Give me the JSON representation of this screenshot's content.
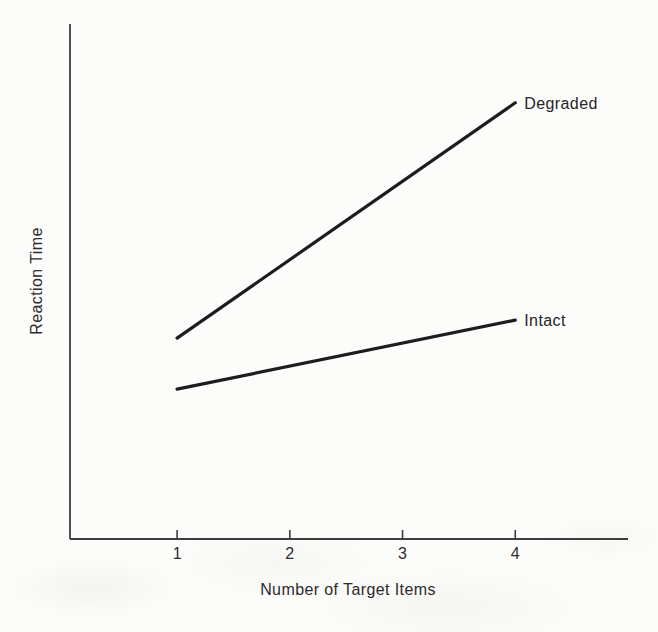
{
  "figure": {
    "background": "#fcfcfa",
    "axis_color": "#3d3d3d",
    "line_color": "#1d1d1d",
    "text_color": "#2c2c2c"
  },
  "chart_data": {
    "type": "line",
    "title": "",
    "xlabel": "Number of Target Items",
    "ylabel": "Reaction Time",
    "xlim": [
      0.05,
      5.0
    ],
    "ylim": [
      0,
      1
    ],
    "xticks": [
      1,
      2,
      3,
      4
    ],
    "xtick_labels": [
      "1",
      "2",
      "3",
      "4"
    ],
    "yticks_shown": false,
    "grid": false,
    "legend_position": "end-of-line-labels",
    "series": [
      {
        "name": "Degraded",
        "x": [
          1,
          4
        ],
        "y": [
          0.39,
          0.847
        ]
      },
      {
        "name": "Intact",
        "x": [
          1,
          4
        ],
        "y": [
          0.291,
          0.425
        ]
      }
    ]
  }
}
